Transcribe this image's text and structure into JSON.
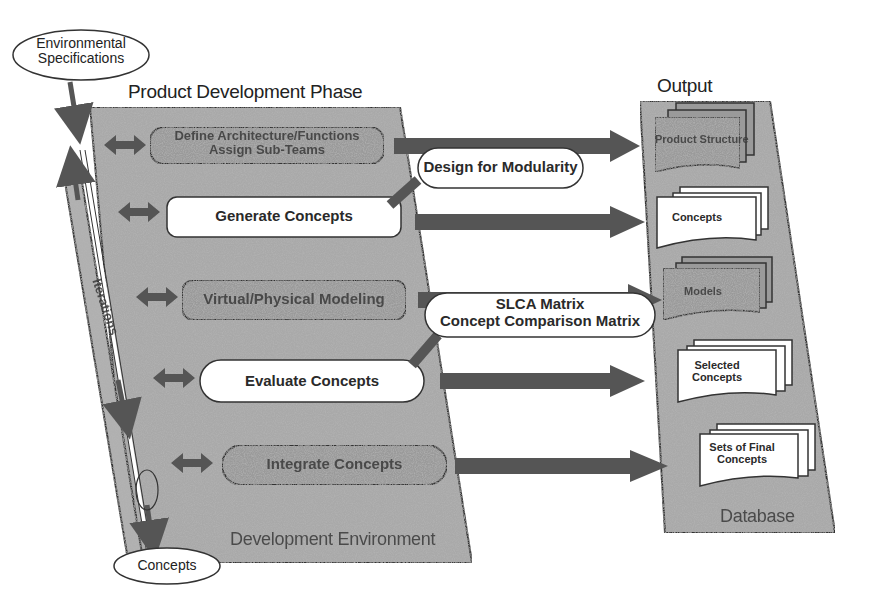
{
  "diagram": {
    "inputs": {
      "environmental_specifications": [
        "Environmental",
        "Specifications"
      ],
      "concepts_out": "Concepts"
    },
    "iterations_label": "Iterations",
    "product_development_phase": {
      "title": "Product Development Phase",
      "footer": "Development Environment",
      "steps": [
        {
          "label": [
            "Define Architecture/Functions",
            "Assign Sub-Teams"
          ],
          "style": "shaded"
        },
        {
          "label": [
            "Generate Concepts"
          ],
          "style": "white"
        },
        {
          "label": [
            "Virtual/Physical Modeling"
          ],
          "style": "shaded"
        },
        {
          "label": [
            "Evaluate Concepts"
          ],
          "style": "white-pill"
        },
        {
          "label": [
            "Integrate Concepts"
          ],
          "style": "shaded-pill"
        }
      ]
    },
    "tools": [
      {
        "label": [
          "Design for Modularity"
        ]
      },
      {
        "label": [
          "SLCA Matrix",
          "Concept Comparison Matrix"
        ]
      }
    ],
    "output": {
      "title": "Output",
      "footer": "Database",
      "documents": [
        {
          "label": [
            "Product Structure"
          ],
          "style": "shaded"
        },
        {
          "label": [
            "Concepts"
          ],
          "style": "white"
        },
        {
          "label": [
            "Models"
          ],
          "style": "shaded"
        },
        {
          "label": [
            "Selected",
            "Concepts"
          ],
          "style": "white"
        },
        {
          "label": [
            "Sets of Final",
            "Concepts"
          ],
          "style": "white"
        }
      ]
    },
    "colors": {
      "texture": "#a9a9a9",
      "texture_dark": "#7d7d7d",
      "arrow": "#555555",
      "outline": "#333333",
      "white_box": "#ffffff"
    }
  }
}
